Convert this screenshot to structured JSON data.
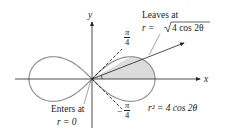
{
  "diagram": {
    "axis_x_label": "x",
    "axis_y_label": "y",
    "leaves_label_line1": "Leaves at",
    "leaves_label_line2_prefix": "r = ",
    "leaves_label_line2_sqrt": "4 cos 2θ",
    "enters_label_line1": "Enters at",
    "enters_label_line2": "r = 0",
    "curve_label": "r² = 4 cos 2θ",
    "angle_upper": {
      "num": "π",
      "den": "4",
      "sign": ""
    },
    "angle_lower": {
      "num": "π",
      "den": "4",
      "sign": "−"
    },
    "colors": {
      "curve": "#888888",
      "shade": "#dcdcdc",
      "axis": "#222222",
      "text": "#222222"
    }
  },
  "chart_data": {
    "type": "polar-curve",
    "equation": "r^2 = 4 cos 2θ",
    "a": 2,
    "shaded_region": {
      "theta_from": 0,
      "theta_to": 0.5236
    },
    "ray_angles": [
      0.7854,
      -0.7854
    ],
    "annotations": [
      "Leaves at r = √(4 cos 2θ)",
      "Enters at r = 0",
      "π/4",
      "−π/4"
    ]
  }
}
